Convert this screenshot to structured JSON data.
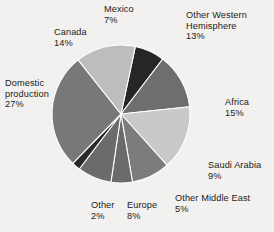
{
  "chart_data": {
    "type": "pie",
    "title": "",
    "subtitle": "",
    "xlabel": "",
    "ylabel": "",
    "legend_position": "none",
    "grid": false,
    "labels_show_percent": true,
    "background_color": "#f2f1ef",
    "slice_separator_color": "#ffffff",
    "start_angle_deg": -78,
    "direction": "clockwise",
    "categories": [
      "Mexico",
      "Other Western Hemisphere",
      "Africa",
      "Saudi Arabia",
      "Other Middle East",
      "Europe",
      "Other",
      "Domestic production",
      "Canada"
    ],
    "values": [
      7,
      13,
      15,
      9,
      5,
      8,
      2,
      27,
      14
    ],
    "value_labels": [
      "7%",
      "13%",
      "15%",
      "9%",
      "5%",
      "8%",
      "2%",
      "27%",
      "14%"
    ],
    "colors": [
      "#262626",
      "#6e6e6e",
      "#c9c9c9",
      "#7c7c7c",
      "#6a6a6a",
      "#6b6b6b",
      "#2a2a2a",
      "#787878",
      "#bdbdbd"
    ],
    "slices": [
      {
        "name": "Mexico",
        "value": 7,
        "value_label": "7%",
        "color": "#262626"
      },
      {
        "name": "Other Western Hemisphere",
        "value": 13,
        "value_label": "13%",
        "color": "#6e6e6e"
      },
      {
        "name": "Africa",
        "value": 15,
        "value_label": "15%",
        "color": "#c9c9c9"
      },
      {
        "name": "Saudi Arabia",
        "value": 9,
        "value_label": "9%",
        "color": "#7c7c7c"
      },
      {
        "name": "Other Middle East",
        "value": 5,
        "value_label": "5%",
        "color": "#6a6a6a"
      },
      {
        "name": "Europe",
        "value": 8,
        "value_label": "8%",
        "color": "#6b6b6b"
      },
      {
        "name": "Other",
        "value": 2,
        "value_label": "2%",
        "color": "#2a2a2a"
      },
      {
        "name": "Domestic production",
        "value": 27,
        "value_label": "27%",
        "color": "#787878"
      },
      {
        "name": "Canada",
        "value": 14,
        "value_label": "14%",
        "color": "#bdbdbd"
      }
    ],
    "total": 100
  },
  "labels": {
    "mexico": {
      "name": "Mexico",
      "value": "7%"
    },
    "other_western_hemisphere": {
      "name_line1": "Other Western",
      "name_line2": "Hemisphere",
      "value": "13%"
    },
    "canada": {
      "name": "Canada",
      "value": "14%"
    },
    "africa": {
      "name": "Africa",
      "value": "15%"
    },
    "domestic_production": {
      "name_line1": "Domestic",
      "name_line2": "production",
      "value": "27%"
    },
    "saudi_arabia": {
      "name": "Saudi Arabia",
      "value": "9%"
    },
    "other_middle_east": {
      "name": "Other Middle East",
      "value": "5%"
    },
    "europe": {
      "name": "Europe",
      "value": "8%"
    },
    "other": {
      "name": "Other",
      "value": "2%"
    }
  }
}
